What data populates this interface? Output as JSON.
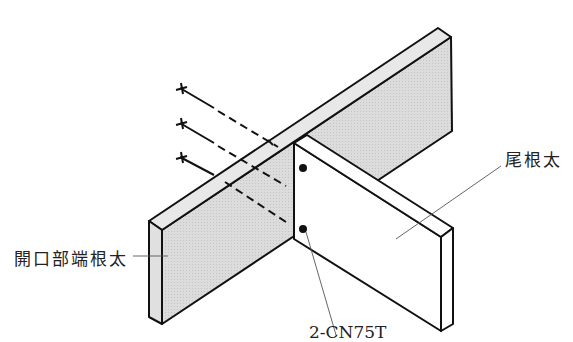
{
  "diagram": {
    "type": "isometric joinery detail",
    "colors": {
      "line": "#111111",
      "shaded_face": "#d9d9d9",
      "top_face": "#e6e6e6",
      "white_face": "#ffffff",
      "leader": "#555555"
    },
    "labels": {
      "header_joist": "開口部端根太",
      "tail_joist": "尾根太",
      "nails": "2-CN75T"
    },
    "nail_count_end_nailed": 3,
    "nail_count_toe_nailed": 2
  }
}
